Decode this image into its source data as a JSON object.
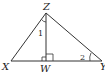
{
  "diagram": {
    "vertices": {
      "Z": {
        "label": "Z",
        "x": 46,
        "y": 13
      },
      "X": {
        "label": "X",
        "x": 11,
        "y": 61
      },
      "W": {
        "label": "W",
        "x": 46,
        "y": 61
      },
      "Y": {
        "label": "Y",
        "x": 102,
        "y": 61
      }
    },
    "angles": {
      "angle1": {
        "label": "1"
      },
      "angle2": {
        "label": "2"
      }
    },
    "colors": {
      "stroke": "#333333",
      "text": "#222222",
      "background": "#ffffff"
    }
  }
}
